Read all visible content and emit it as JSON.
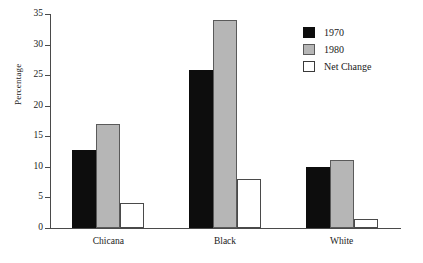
{
  "chart_data": {
    "type": "bar",
    "title": "",
    "xlabel": "",
    "ylabel": "Percentage",
    "ylim": [
      0,
      35
    ],
    "ytick_step": 5,
    "yticks": [
      0,
      5,
      10,
      15,
      20,
      25,
      30,
      35
    ],
    "ytick_labels": [
      "0",
      "5",
      "10",
      "15",
      "20",
      "25",
      "30",
      "35"
    ],
    "grid": false,
    "legend_position": "top-right",
    "categories": [
      "Chicana",
      "Black",
      "White"
    ],
    "series": [
      {
        "name": "1970",
        "color": "#0d0d0d",
        "values": [
          12.8,
          25.9,
          10.0
        ]
      },
      {
        "name": "1980",
        "color": "#b6b6b6",
        "values": [
          17.0,
          34.1,
          11.1
        ]
      },
      {
        "name": "Net Change",
        "color": "#ffffff",
        "values": [
          4.1,
          8.0,
          1.5
        ]
      }
    ]
  },
  "legend": {
    "items": [
      {
        "label": "1970"
      },
      {
        "label": "1980"
      },
      {
        "label": "Net Change"
      }
    ]
  }
}
